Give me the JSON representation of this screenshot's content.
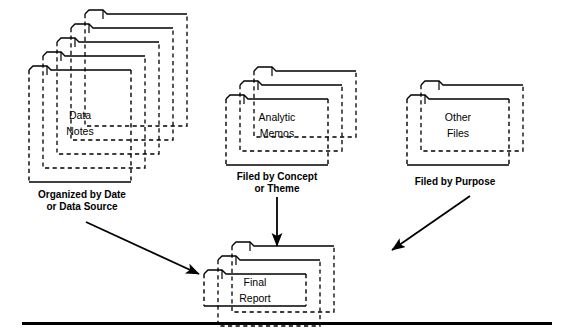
{
  "diagram": {
    "background_color": "#ffffff",
    "line_color": "#000000",
    "groups": [
      {
        "id": "data-notes",
        "name": "Data Notes",
        "label_line1": "Data",
        "label_line2": "Notes",
        "caption_line1": "Organized by Date",
        "caption_line2": "or Data Source",
        "folder_count": 5
      },
      {
        "id": "analytic-memos",
        "name": "Analytic Memos",
        "label_line1": "Analytic",
        "label_line2": "Memos",
        "caption_line1": "Filed by Concept",
        "caption_line2": "or Theme",
        "folder_count": 3
      },
      {
        "id": "other-files",
        "name": "Other Files",
        "label_line1": "Other",
        "label_line2": "Files",
        "caption_line1": "Filed by Purpose",
        "caption_line2": "",
        "folder_count": 2
      },
      {
        "id": "final-report",
        "name": "Final Report",
        "label_line1": "Final",
        "label_line2": "Report",
        "caption_line1": "",
        "caption_line2": "",
        "folder_count": 3
      }
    ],
    "arrows": [
      {
        "id": "arrow-data-notes-to-final-report",
        "from": "data-notes",
        "to": "final-report",
        "direction": "down-right"
      },
      {
        "id": "arrow-analytic-memos-to-final-report",
        "from": "analytic-memos",
        "to": "final-report",
        "direction": "down"
      },
      {
        "id": "arrow-other-files-to-final-report",
        "from": "other-files",
        "to": "final-report",
        "direction": "down-left"
      }
    ],
    "footer_rule": {
      "id": "bottom-rule",
      "visible": true
    }
  }
}
